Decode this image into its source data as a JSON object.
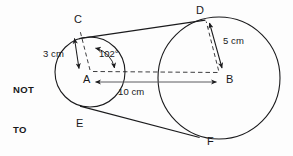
{
  "figure": {
    "kind": "geometry-diagram",
    "note": {
      "line1": "NOT",
      "line2": "TO",
      "line3": "SCALE",
      "full": "NOT TO SCALE"
    },
    "colors": {
      "stroke": "#1b1b1d",
      "background": "#fdfdfd",
      "text": "#18181a"
    },
    "points": [
      {
        "id": "A",
        "label": "A",
        "role": "center-of-small-circle"
      },
      {
        "id": "B",
        "label": "B",
        "role": "center-of-large-circle"
      },
      {
        "id": "C",
        "label": "C",
        "role": "upper-tangent-point-small-circle"
      },
      {
        "id": "D",
        "label": "D",
        "role": "upper-tangent-point-large-circle"
      },
      {
        "id": "E",
        "label": "E",
        "role": "lower-tangent-point-small-circle"
      },
      {
        "id": "F",
        "label": "F",
        "role": "lower-tangent-point-large-circle"
      }
    ],
    "dimensions": [
      {
        "id": "radius-small",
        "value": "3 cm",
        "from": "C",
        "to": "A"
      },
      {
        "id": "radius-large",
        "value": "5 cm",
        "from": "D",
        "to": "B"
      },
      {
        "id": "center-distance",
        "value": "10 cm",
        "from": "A",
        "to": "B"
      }
    ],
    "angles": [
      {
        "id": "angle-CAB",
        "value": "102°",
        "vertex": "A",
        "between": "AC and AB"
      }
    ]
  }
}
